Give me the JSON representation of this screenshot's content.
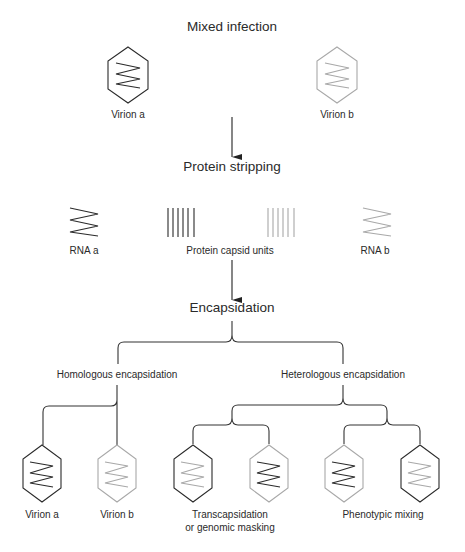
{
  "title": "Mixed infection",
  "colors": {
    "dark": "#2a2a2a",
    "light": "#a8a8a8",
    "line": "#333333"
  },
  "stage1": {
    "virions": [
      {
        "label": "Virion a",
        "capsid": "dark",
        "rna": "dark"
      },
      {
        "label": "Virion b",
        "capsid": "light",
        "rna": "light"
      }
    ]
  },
  "step2": {
    "title": "Protein stripping",
    "rna_a_label": "RNA a",
    "capsid_units_label": "Protein capsid units",
    "rna_b_label": "RNA b"
  },
  "step3": {
    "title": "Encapsidation",
    "branches": {
      "homologous": "Homologous encapsidation",
      "heterologous": "Heterologous encapsidation"
    }
  },
  "outcomes": [
    {
      "label": "Virion a",
      "capsid": "dark",
      "rna": "dark"
    },
    {
      "label": "Virion b",
      "capsid": "light",
      "rna": "light"
    },
    {
      "capsid": "dark",
      "rna": "light"
    },
    {
      "capsid": "light",
      "rna": "dark"
    },
    {
      "capsid": "dark",
      "rna": "dark"
    },
    {
      "capsid": "light",
      "rna": "light"
    }
  ],
  "outcome_groups": {
    "transcapsidation_line1": "Transcapsidation",
    "transcapsidation_line2": "or genomic masking",
    "phenotypic_mixing": "Phenotypic mixing"
  }
}
